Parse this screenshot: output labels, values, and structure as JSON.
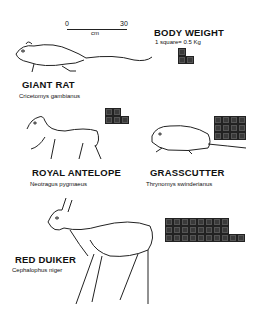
{
  "scale": {
    "zero": "0",
    "max": "30",
    "unit": "cm"
  },
  "legend": {
    "title": "BODY WEIGHT",
    "note": "1 square= 0.5 Kg",
    "kg_per_square": 0.5
  },
  "animals": [
    {
      "common": "GIANT RAT",
      "scientific": "Cricetomys gambianus",
      "squares": 3,
      "rows": [
        1,
        2
      ]
    },
    {
      "common": "ROYAL ANTELOPE",
      "scientific": "Neotragus pygmaeus",
      "squares": 5,
      "rows": [
        2,
        3
      ]
    },
    {
      "common": "GRASSCUTTER",
      "scientific": "Thrynomys swinderianus",
      "squares": 12,
      "rows": [
        4,
        4,
        4
      ]
    },
    {
      "common": "RED DUIKER",
      "scientific": "Cephalophus niger",
      "squares": 26,
      "rows": [
        8,
        8,
        10
      ]
    }
  ]
}
